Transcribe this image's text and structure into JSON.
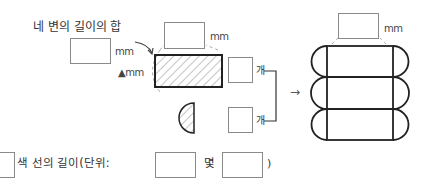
{
  "diagram": {
    "label_perimeter": "네 변의 길이의 합",
    "unit_mm": "mm",
    "triangle_unit": "▲mm",
    "count_unit": "개",
    "arrow": "→",
    "bottom": {
      "prefix": "색 선의 길이(단위: ",
      "unit1": "몇",
      "unit2": "몇",
      "suffix": ")"
    },
    "answer_boxes": {
      "left_length": "",
      "top_length": "",
      "rect_count": "",
      "half_circle_count": "",
      "result_length": "",
      "bottom_answer": "",
      "bottom_unit1_value": "",
      "bottom_unit2_value": ""
    }
  }
}
